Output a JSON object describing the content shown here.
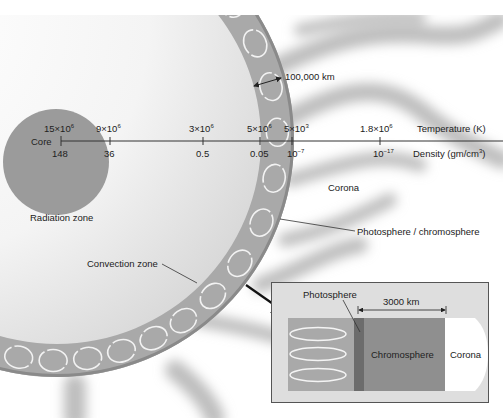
{
  "colors": {
    "core": "#9a9a9a",
    "ring": "#a8a8a8",
    "ring_edge": "#8c8c8c",
    "interior_light": "#fafafa",
    "interior_shade": "#dcdcdc",
    "streamer": "#c4c4c4",
    "inset_bg": "#dedede",
    "inset_convection": "#a9a9a9",
    "inset_photosphere": "#6c6c6c",
    "inset_chromosphere": "#8f8f8f",
    "inset_corona": "#ffffff",
    "axis": "#333333"
  },
  "axis": {
    "temperature_label": "Temperature (K)",
    "density_label": "Density (gm/cm",
    "density_label_exp": "3",
    "density_label_close": ")",
    "ticks": [
      {
        "x": 61,
        "temp_base": "15×10",
        "temp_exp": "6",
        "density_base": "148",
        "density_exp": ""
      },
      {
        "x": 110,
        "temp_base": "9×10",
        "temp_exp": "6",
        "density_base": "36",
        "density_exp": ""
      },
      {
        "x": 203,
        "temp_base": "3×10",
        "temp_exp": "6",
        "density_base": "0.5",
        "density_exp": ""
      },
      {
        "x": 260,
        "temp_base": "5×10",
        "temp_exp": "6",
        "density_base": "0.05",
        "density_exp": ""
      },
      {
        "x": 292,
        "temp_base": "5×10",
        "temp_exp": "3",
        "density_base": "10",
        "density_exp": "−7"
      },
      {
        "x": 380,
        "temp_base": "1.8×10",
        "temp_exp": "6",
        "density_base": "10",
        "density_exp": "−17"
      }
    ]
  },
  "labels": {
    "core": "Core",
    "radiation_zone": "Radiation zone",
    "convection_zone": "Convection zone",
    "corona": "Corona",
    "photosphere_chromosphere": "Photosphere / chromosphere",
    "scale_100000": "100,000 km"
  },
  "inset": {
    "photosphere": "Photosphere",
    "scale_3000": "3000 km",
    "chromosphere": "Chromosphere",
    "corona": "Corona"
  }
}
